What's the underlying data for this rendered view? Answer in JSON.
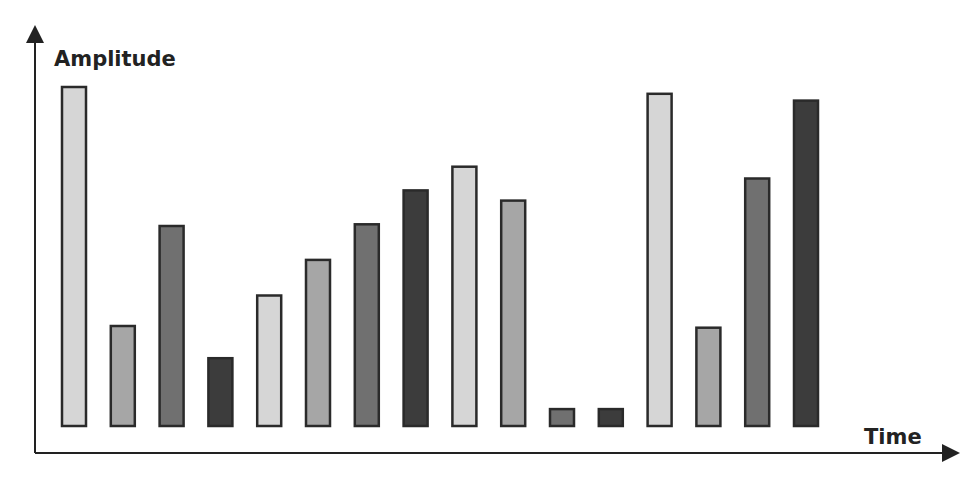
{
  "chart_data": {
    "type": "bar",
    "title": "",
    "xlabel": "Time",
    "ylabel": "Amplitude",
    "ylim": [
      0,
      100
    ],
    "grid": false,
    "legend": "none",
    "categories": [
      "1",
      "2",
      "3",
      "4",
      "5",
      "6",
      "7",
      "8",
      "9",
      "10",
      "11",
      "12",
      "13",
      "14",
      "15",
      "16"
    ],
    "values": [
      100,
      29.5,
      59,
      20,
      38.5,
      49,
      59.5,
      69.5,
      76.5,
      66.5,
      5,
      5,
      98,
      29,
      73,
      96
    ],
    "colors": [
      "#d6d6d6",
      "#a6a6a6",
      "#707070",
      "#3c3c3c",
      "#d6d6d6",
      "#a6a6a6",
      "#707070",
      "#3c3c3c",
      "#d6d6d6",
      "#a6a6a6",
      "#707070",
      "#3c3c3c",
      "#d6d6d6",
      "#a6a6a6",
      "#707070",
      "#3c3c3c"
    ],
    "outline_color": "#2a2a2a",
    "axis_color": "#222222"
  }
}
